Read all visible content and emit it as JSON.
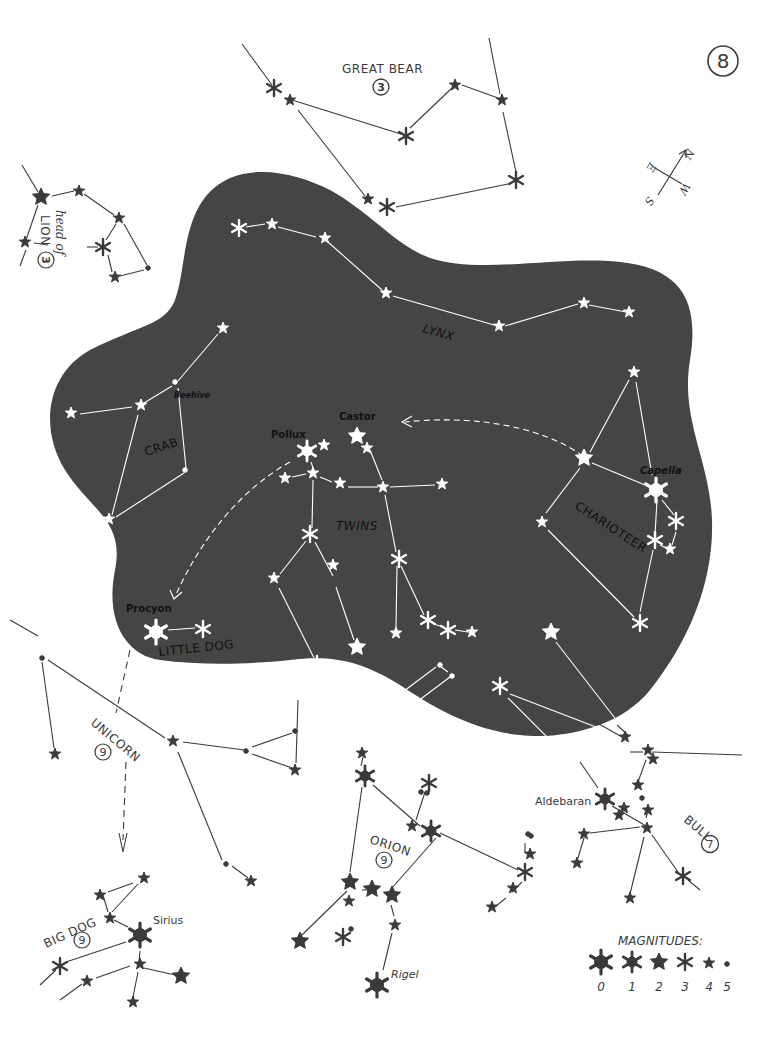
{
  "page": {
    "chart_number": "8",
    "background": "#ffffff",
    "sky_region_color": "#454545",
    "ink_color": "#3a3a3a",
    "star_on_dark_color": "#ffffff"
  },
  "compass": {
    "north": "N",
    "south": "S",
    "east": "E",
    "west": "W"
  },
  "constellations": [
    {
      "id": "great-bear",
      "label": "GREAT BEAR",
      "chart_ref": "3"
    },
    {
      "id": "lion",
      "label": "LION",
      "prefix": "head of",
      "chart_ref": "3"
    },
    {
      "id": "lynx",
      "label": "LYNX"
    },
    {
      "id": "crab",
      "label": "CRAB"
    },
    {
      "id": "twins",
      "label": "TWINS"
    },
    {
      "id": "charioteer",
      "label": "CHARIOTEER"
    },
    {
      "id": "little-dog",
      "label": "LITTLE DOG"
    },
    {
      "id": "unicorn",
      "label": "UNICORN",
      "chart_ref": "9"
    },
    {
      "id": "orion",
      "label": "ORION",
      "chart_ref": "9"
    },
    {
      "id": "bull",
      "label": "BULL",
      "chart_ref": "7"
    },
    {
      "id": "big-dog",
      "label": "BIG DOG",
      "chart_ref": "9"
    }
  ],
  "named_stars": {
    "castor": "Castor",
    "pollux": "Pollux",
    "capella": "Capella",
    "procyon": "Procyon",
    "sirius": "Sirius",
    "rigel": "Rigel",
    "aldebaran": "Aldebaran",
    "beehive": "Beehive"
  },
  "legend": {
    "title": "MAGNITUDES:",
    "magnitudes": [
      "0",
      "1",
      "2",
      "3",
      "4",
      "5"
    ]
  }
}
